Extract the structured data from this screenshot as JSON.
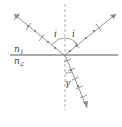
{
  "diagram": {
    "type": "reflection-refraction",
    "labels": {
      "medium_top": "n",
      "medium_top_sub": "1",
      "medium_bottom": "n",
      "medium_bottom_sub": "2",
      "incident_angle": "i",
      "reflected_angle": "i",
      "refracted_angle": "γ"
    },
    "colors": {
      "ray": "#888888",
      "dot": "#777777",
      "interface": "#555555",
      "normal": "#999999",
      "text": "#444444"
    }
  }
}
